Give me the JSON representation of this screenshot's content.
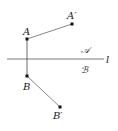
{
  "diagram": {
    "line_label": "l",
    "half_plane_upper": "𝒜",
    "half_plane_lower": "ℬ",
    "points": {
      "A": {
        "label": "A",
        "x": 27,
        "y": 39
      },
      "A_prime": {
        "label": "A′",
        "x": 72,
        "y": 24
      },
      "B": {
        "label": "B",
        "x": 27,
        "y": 76
      },
      "B_prime": {
        "label": "B′",
        "x": 60,
        "y": 107
      }
    },
    "colors": {
      "stroke": "#444444",
      "point": "#111111",
      "text": "#222222"
    }
  }
}
